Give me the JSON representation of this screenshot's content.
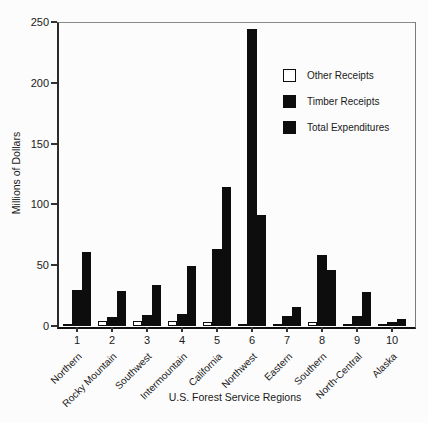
{
  "chart_data": {
    "type": "bar",
    "title": "",
    "xlabel": "U.S. Forest Service Regions",
    "ylabel": "Millions of Dollars",
    "ylim": [
      0,
      250
    ],
    "yticks": [
      0,
      50,
      100,
      150,
      200,
      250
    ],
    "grid": false,
    "legend_position": "upper right",
    "categories": [
      "1",
      "2",
      "3",
      "4",
      "5",
      "6",
      "7",
      "8",
      "9",
      "10"
    ],
    "category_names": [
      "Northern",
      "Rocky Mountain",
      "Southwest",
      "Intermountain",
      "California",
      "Northwest",
      "Eastern",
      "Southern",
      "North-Central",
      "Alaska"
    ],
    "series": [
      {
        "name": "Other Receipts",
        "color": "#ffffff",
        "values": [
          2,
          4,
          4,
          4,
          3,
          2,
          2,
          3,
          1,
          1
        ]
      },
      {
        "name": "Timber Receipts",
        "color": "#0d0d0d",
        "values": [
          30,
          7,
          9,
          10,
          63,
          244,
          8,
          58,
          8,
          3
        ]
      },
      {
        "name": "Total Expenditures",
        "color": "#0d0d0d",
        "values": [
          61,
          29,
          34,
          49,
          114,
          91,
          16,
          46,
          28,
          6
        ]
      }
    ]
  },
  "colors": {
    "background": "#fcfcfc",
    "bar_black": "#0d0d0d",
    "bar_white": "#ffffff",
    "axis": "#2b2b2b"
  }
}
